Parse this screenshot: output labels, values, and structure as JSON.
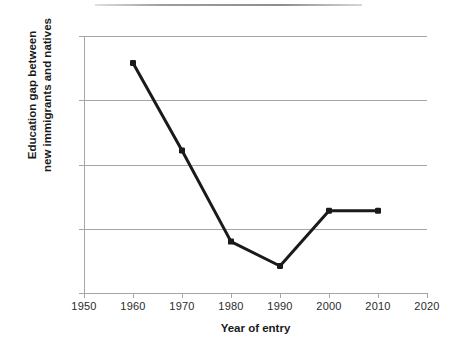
{
  "figure": {
    "top_rule": "horizontal-rule",
    "background_color": "#ffffff",
    "series_color": "#1a1a1a",
    "gridline_color": "#a6a6a6",
    "text_color": "#1a1a1a"
  },
  "chart_data": {
    "type": "line",
    "title": "",
    "xlabel": "Year of entry",
    "ylabel": "Education gap between new immigrants and natives",
    "ylabel_line1": "Education gap between",
    "ylabel_line2": "new immigrants and natives",
    "x": [
      1960,
      1970,
      1980,
      1990,
      2000,
      2010
    ],
    "values": [
      -0.21,
      -0.89,
      -1.6,
      -1.79,
      -1.36,
      -1.36
    ],
    "series": [
      {
        "name": "Education gap",
        "values": [
          -0.21,
          -0.89,
          -1.6,
          -1.79,
          -1.36,
          -1.36
        ]
      }
    ],
    "xlim": [
      1950,
      2020
    ],
    "ylim": [
      -2.0,
      0.0
    ],
    "xticks": [
      1950,
      1960,
      1970,
      1980,
      1990,
      2000,
      2010,
      2020
    ],
    "xtick_labels": [
      "1950",
      "1960",
      "1970",
      "1980",
      "1990",
      "2000",
      "2010",
      "2020"
    ],
    "yticks": [
      0.0,
      -0.5,
      -1.0,
      -1.5,
      -2.0
    ],
    "ytick_labels": [
      "0.0",
      "-0.5",
      "-1.0",
      "-1.5",
      "-2.0"
    ],
    "grid": true,
    "grid_axis": "y",
    "legend": false,
    "legend_position": "none",
    "markers": "square",
    "line_width": 3
  }
}
